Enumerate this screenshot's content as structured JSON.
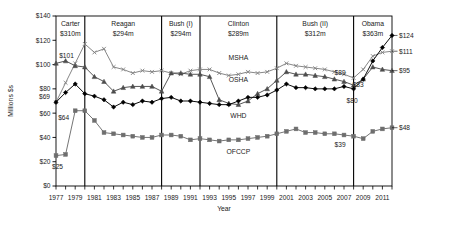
{
  "chart_data": {
    "type": "line",
    "title": "",
    "xlabel": "Year",
    "ylabel": "Millions $s",
    "xlim": [
      1977,
      2012
    ],
    "ylim": [
      0,
      140
    ],
    "ytick_labels": [
      "$0",
      "$20",
      "$40",
      "$60",
      "$80",
      "$100",
      "$120",
      "$140"
    ],
    "ytick_values": [
      0,
      20,
      40,
      60,
      80,
      100,
      120,
      140
    ],
    "xtick_labels": [
      "1977",
      "1979",
      "1981",
      "1983",
      "1985",
      "1987",
      "1989",
      "1991",
      "1993",
      "1995",
      "1997",
      "1999",
      "2001",
      "2003",
      "2005",
      "2007",
      "2009",
      "2011"
    ],
    "xtick_values": [
      1977,
      1979,
      1981,
      1983,
      1985,
      1987,
      1989,
      1991,
      1993,
      1995,
      1997,
      1999,
      2001,
      2003,
      2005,
      2007,
      2009,
      2011
    ],
    "grid": false,
    "legend_position": "inline-labels",
    "x": [
      1977,
      1978,
      1979,
      1980,
      1981,
      1982,
      1983,
      1984,
      1985,
      1986,
      1987,
      1988,
      1989,
      1990,
      1991,
      1992,
      1993,
      1994,
      1995,
      1996,
      1997,
      1998,
      1999,
      2000,
      2001,
      2002,
      2003,
      2004,
      2005,
      2006,
      2007,
      2008,
      2009,
      2010,
      2011,
      2012
    ],
    "series": [
      {
        "name": "MSHA",
        "marker": "x",
        "color": "#808080",
        "values": [
          69,
          85,
          101,
          117,
          110,
          113,
          98,
          96,
          93,
          95,
          94,
          95,
          93,
          92,
          95,
          96,
          96,
          93,
          91,
          92,
          94,
          93,
          94,
          97,
          101,
          99,
          98,
          97,
          96,
          94,
          92,
          89,
          96,
          107,
          110,
          111
        ]
      },
      {
        "name": "OSHA",
        "marker": "triangle",
        "color": "#4d4d4d",
        "values": [
          101,
          103,
          99,
          98,
          90,
          86,
          78,
          81,
          82,
          82,
          82,
          78,
          93,
          93,
          92,
          92,
          90,
          71,
          68,
          67,
          70,
          76,
          80,
          87,
          94,
          92,
          92,
          91,
          90,
          88,
          86,
          83,
          88,
          98,
          96,
          95
        ]
      },
      {
        "name": "WHD",
        "marker": "diamond",
        "color": "#000000",
        "values": [
          69,
          77,
          84,
          76,
          74,
          71,
          65,
          69,
          67,
          70,
          69,
          72,
          73,
          70,
          70,
          69,
          68,
          67,
          67,
          70,
          73,
          73,
          75,
          79,
          84,
          81,
          81,
          80,
          80,
          80,
          82,
          80,
          88,
          103,
          114,
          124
        ]
      },
      {
        "name": "OFCCP",
        "marker": "square",
        "color": "#6e6e6e",
        "values": [
          25,
          26,
          62,
          62,
          54,
          44,
          43,
          42,
          41,
          40,
          40,
          42,
          42,
          41,
          38,
          39,
          38,
          37,
          38,
          38,
          39,
          40,
          41,
          43,
          45,
          47,
          44,
          44,
          43,
          43,
          42,
          41,
          39,
          45,
          47,
          48
        ]
      }
    ],
    "point_annotations": [
      {
        "label": "$101",
        "x": 1979,
        "y": 101,
        "series": "OSHA"
      },
      {
        "label": "$69",
        "x": 1977,
        "y": 69,
        "series": "MSHA"
      },
      {
        "label": "$64",
        "x": 1979,
        "y": 62,
        "series": "OFCCP"
      },
      {
        "label": "$25",
        "x": 1977,
        "y": 25,
        "series": "OFCCP"
      },
      {
        "label": "$89",
        "x": 2008,
        "y": 89,
        "series": "OSHA"
      },
      {
        "label": "$83",
        "x": 2008,
        "y": 83,
        "series": "MSHA"
      },
      {
        "label": "$80",
        "x": 2008,
        "y": 80,
        "series": "WHD"
      },
      {
        "label": "$39",
        "x": 2008,
        "y": 39,
        "series": "OFCCP"
      },
      {
        "label": "$124",
        "x": 2012,
        "y": 124,
        "series": "WHD"
      },
      {
        "label": "$111",
        "x": 2012,
        "y": 111,
        "series": "MSHA"
      },
      {
        "label": "$95",
        "x": 2012,
        "y": 95,
        "series": "OSHA"
      },
      {
        "label": "$48",
        "x": 2012,
        "y": 48,
        "series": "OFCCP"
      }
    ],
    "presidential_periods": [
      {
        "name": "Carter",
        "budget": "$310m",
        "start": 1977,
        "end": 1980
      },
      {
        "name": "Reagan",
        "budget": "$294m",
        "start": 1980,
        "end": 1988
      },
      {
        "name": "Bush (I)",
        "budget": "$294m",
        "start": 1988,
        "end": 1992
      },
      {
        "name": "Clinton",
        "budget": "$289m",
        "start": 1992,
        "end": 2000
      },
      {
        "name": "Bush (II)",
        "budget": "$312m",
        "start": 2000,
        "end": 2008
      },
      {
        "name": "Obama",
        "budget": "$363m",
        "start": 2008,
        "end": 2012
      }
    ],
    "series_inline_labels": [
      {
        "name": "MSHA",
        "x": 1996,
        "y": 104
      },
      {
        "name": "OSHA",
        "x": 1996,
        "y": 86
      },
      {
        "name": "WHD",
        "x": 1996,
        "y": 56
      },
      {
        "name": "OFCCP",
        "x": 1996,
        "y": 26
      }
    ]
  }
}
